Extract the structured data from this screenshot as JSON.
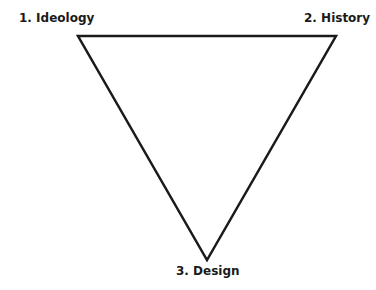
{
  "diagram": {
    "shape": "inverted-triangle",
    "vertices": [
      {
        "id": "ideology",
        "label": "1. Ideology",
        "x": 78,
        "y": 36
      },
      {
        "id": "history",
        "label": "2. History",
        "x": 336,
        "y": 36
      },
      {
        "id": "design",
        "label": "3. Design",
        "x": 207,
        "y": 260
      }
    ],
    "stroke_color": "#1a1a1a"
  }
}
